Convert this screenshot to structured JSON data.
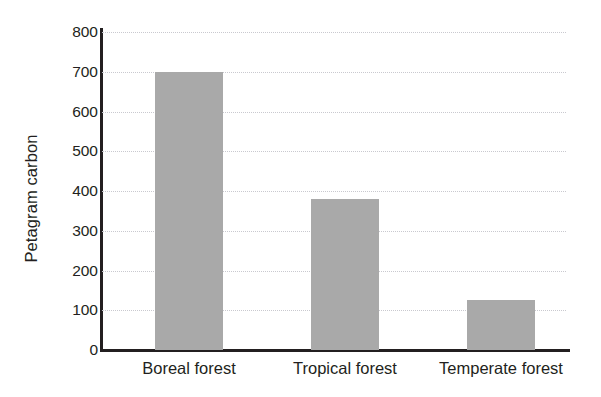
{
  "chart_data": {
    "type": "bar",
    "title": "",
    "subtitle": "",
    "xlabel": "",
    "ylabel": "Petagram carbon",
    "categories": [
      "Boreal forest",
      "Tropical forest",
      "Temperate forest"
    ],
    "values": [
      700,
      380,
      125
    ],
    "ylim": [
      0,
      800
    ],
    "ytick_values": [
      0,
      100,
      200,
      300,
      400,
      500,
      600,
      700,
      800
    ],
    "ytick_labels": [
      "0",
      "100",
      "200",
      "300",
      "400",
      "500",
      "600",
      "700",
      "800"
    ],
    "grid": "horizontal-dotted",
    "legend": "none",
    "bar_color": "#a9a9a9",
    "axis_color": "#231f20",
    "gridline_color": "#c9c9cf",
    "background_color": "#ffffff"
  }
}
